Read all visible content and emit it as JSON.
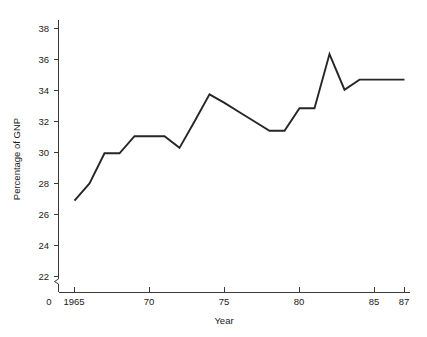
{
  "chart_data": {
    "type": "line",
    "title": "",
    "xlabel": "Year",
    "ylabel": "Percentage of GNP",
    "grid": false,
    "legend": "none",
    "xlim": [
      1965,
      1987
    ],
    "ylim": [
      22,
      39
    ],
    "y_axis_break": true,
    "y_axis_origin_label": "0",
    "x_tick_values": [
      1965,
      1970,
      1975,
      1980,
      1985,
      1987
    ],
    "x_tick_labels": [
      "1965",
      "70",
      "75",
      "80",
      "85",
      "87"
    ],
    "y_tick_values": [
      22,
      24,
      26,
      28,
      30,
      32,
      34,
      36,
      38
    ],
    "y_tick_labels": [
      "22",
      "24",
      "26",
      "28",
      "30",
      "32",
      "34",
      "36",
      "38"
    ],
    "series": [
      {
        "name": "Percentage of GNP",
        "color": "#262626",
        "x": [
          1965,
          1966,
          1967,
          1968,
          1969,
          1970,
          1971,
          1972,
          1973,
          1974,
          1975,
          1976,
          1977,
          1978,
          1979,
          1980,
          1981,
          1982,
          1983,
          1984,
          1985,
          1986,
          1987
        ],
        "values": [
          26.9,
          28.0,
          29.95,
          29.95,
          31.05,
          31.05,
          31.05,
          30.3,
          32.0,
          33.75,
          33.2,
          32.6,
          32.0,
          31.4,
          31.4,
          32.85,
          32.85,
          36.35,
          34.05,
          34.7,
          34.7,
          34.7,
          34.7
        ]
      }
    ]
  },
  "axis": {
    "origin_label": "0",
    "y_title": "Percentage of GNP",
    "x_title": "Year"
  }
}
